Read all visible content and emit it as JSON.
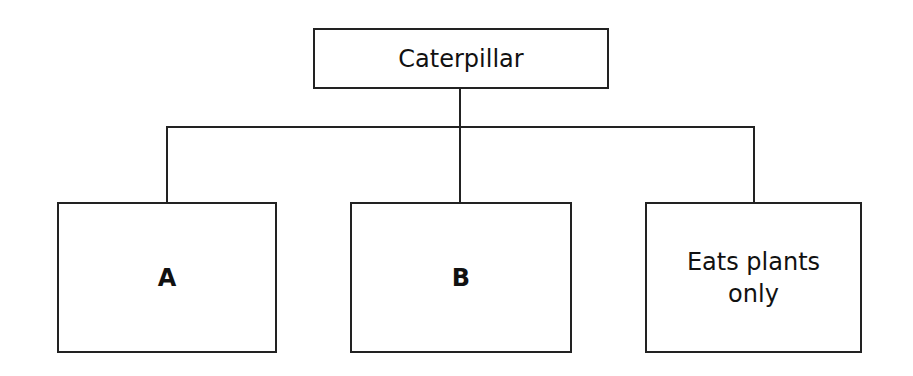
{
  "diagram": {
    "type": "tree",
    "root": {
      "label": "Caterpillar"
    },
    "children": [
      {
        "id": "A",
        "label": "A"
      },
      {
        "id": "B",
        "label": "B"
      },
      {
        "id": "C",
        "label": "Eats plants only"
      }
    ],
    "colors": {
      "line": "#222222",
      "background": "#ffffff",
      "text": "#111111"
    }
  }
}
